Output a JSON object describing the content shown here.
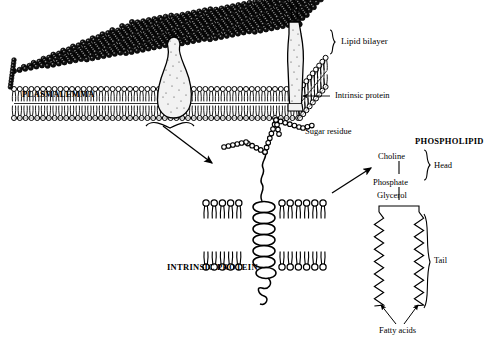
{
  "figure": {
    "ink_color": "#000000",
    "background_color": "#ffffff"
  },
  "labels": {
    "plasmalemma": "PLASMALEMMA",
    "lipid_bilayer": "Lipid bilayer",
    "intrinsic_protein_top": "Intrinsic protein",
    "sugar_residue": "Sugar residue",
    "intrinsic_protein_detail": "INTRINSIC PROTEIN",
    "phospholipid": "PHOSPHOLIPID",
    "choline": "Choline",
    "phosphate": "Phosphate",
    "glycerol": "Glycerol",
    "head": "Head",
    "tail": "Tail",
    "fatty_acids": "Fatty acids"
  },
  "panels": [
    {
      "name": "membrane-block",
      "description": "Three-dimensional slab of plasma membrane showing bilayer of phospholipids with two embedded intrinsic proteins"
    },
    {
      "name": "intrinsic-protein-detail",
      "description": "Enlarged view of a single helical intrinsic protein spanning the lipid bilayer with branched sugar residues"
    },
    {
      "name": "phospholipid-detail",
      "description": "Single phospholipid molecule: choline-phosphate-glycerol head and two fatty acid tails"
    }
  ],
  "phospholipid_chain": [
    "Choline",
    "Phosphate",
    "Glycerol"
  ],
  "brackets": [
    {
      "name": "lipid-bilayer-brace",
      "label": "Lipid bilayer"
    },
    {
      "name": "head-brace",
      "label": "Head"
    },
    {
      "name": "tail-brace",
      "label": "Tail"
    }
  ]
}
